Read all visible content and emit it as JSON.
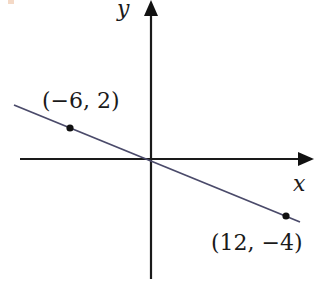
{
  "diagram": {
    "type": "coordinate-plane-line",
    "axes": {
      "x_label": "x",
      "y_label": "y"
    },
    "line": {
      "color": "#4a4a6a",
      "description": "straight line through origin with negative slope"
    },
    "points": [
      {
        "label": "(−6, 2)",
        "x": -6,
        "y": 2
      },
      {
        "label": "(12, −4)",
        "x": 12,
        "y": -4
      }
    ],
    "colors": {
      "axis": "#1a1a1a",
      "line": "#4a4a6a",
      "point": "#111111"
    }
  }
}
